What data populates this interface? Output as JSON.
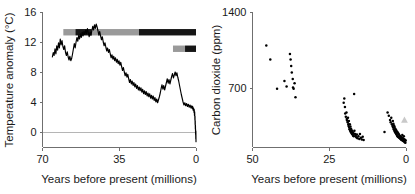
{
  "figure": {
    "title": "",
    "panels": [
      "temperature-anomaly",
      "carbon-dioxide"
    ]
  },
  "chart_data": [
    {
      "type": "line",
      "id": "temperature-anomaly",
      "title": "",
      "xlabel": "Years before present (millions)",
      "ylabel": "Temperature anomaly (°C)",
      "xlim": [
        70,
        0
      ],
      "ylim": [
        -2,
        16
      ],
      "xticks": [
        70,
        35,
        0
      ],
      "yticks": [
        16,
        12,
        8,
        4,
        0
      ],
      "xtick_labels": [
        "70",
        "35",
        "0"
      ],
      "ytick_labels": [
        "16",
        "12",
        "8",
        "4",
        "0"
      ],
      "grid": false,
      "zero_reference_line": 0,
      "legend": "none",
      "series": [
        {
          "name": "Temperature anomaly",
          "color": "#000000",
          "x": [
            65.5,
            65.1,
            64.7,
            64.3,
            63.9,
            63.5,
            63.1,
            62.7,
            62.3,
            61.9,
            61.5,
            61.1,
            60.7,
            60.3,
            59.9,
            59.5,
            59.1,
            58.7,
            58.3,
            57.9,
            57.5,
            57.1,
            56.7,
            56.3,
            55.9,
            55.5,
            55.1,
            54.7,
            54.3,
            53.9,
            53.5,
            53.1,
            52.7,
            52.3,
            51.9,
            51.5,
            51.1,
            50.7,
            50.3,
            49.9,
            49.5,
            49.1,
            48.7,
            48.3,
            47.9,
            47.5,
            47.1,
            46.7,
            46.3,
            45.9,
            45.5,
            45.1,
            44.7,
            44.3,
            43.9,
            43.5,
            43.1,
            42.7,
            42.3,
            41.9,
            41.5,
            41.1,
            40.7,
            40.3,
            39.9,
            39.5,
            39.1,
            38.7,
            38.3,
            37.9,
            37.5,
            37.1,
            36.7,
            36.3,
            35.9,
            35.5,
            35.1,
            34.7,
            34.3,
            33.9,
            33.5,
            33.1,
            32.7,
            32.3,
            31.9,
            31.5,
            31.1,
            30.7,
            30.3,
            29.9,
            29.5,
            29.1,
            28.7,
            28.3,
            27.9,
            27.5,
            27.1,
            26.7,
            26.3,
            25.9,
            25.5,
            25.1,
            24.7,
            24.3,
            23.9,
            23.5,
            23.1,
            22.7,
            22.3,
            21.9,
            21.5,
            21.1,
            20.7,
            20.3,
            19.9,
            19.5,
            19.1,
            18.7,
            18.3,
            17.9,
            17.5,
            17.1,
            16.7,
            16.3,
            15.9,
            15.5,
            15.1,
            14.7,
            14.3,
            13.9,
            13.5,
            13.1,
            12.7,
            12.3,
            11.9,
            11.5,
            11.1,
            10.7,
            10.3,
            9.9,
            9.5,
            9.1,
            8.7,
            8.3,
            7.9,
            7.5,
            7.1,
            6.7,
            6.3,
            5.9,
            5.5,
            5.1,
            4.7,
            4.3,
            3.9,
            3.5,
            3.1,
            2.7,
            2.3,
            1.9,
            1.7,
            1.5,
            1.3,
            1.1,
            0.9,
            0.8,
            0.7,
            0.6,
            0.5,
            0.45,
            0.4,
            0.35,
            0.3,
            0.25,
            0.2,
            0.15,
            0.1,
            0.05,
            0.0
          ],
          "y": [
            10.0,
            10.6,
            10.2,
            11.1,
            10.4,
            11.5,
            10.9,
            11.9,
            11.2,
            12.4,
            11.6,
            12.2,
            11.4,
            11.0,
            11.5,
            10.6,
            10.2,
            10.7,
            10.0,
            9.6,
            10.1,
            9.5,
            9.8,
            10.4,
            11.1,
            11.8,
            11.2,
            12.0,
            12.6,
            12.1,
            12.9,
            12.4,
            13.1,
            12.6,
            13.3,
            12.8,
            13.4,
            13.0,
            13.6,
            13.1,
            13.8,
            13.2,
            12.7,
            13.3,
            12.9,
            13.5,
            14.1,
            13.6,
            14.3,
            13.8,
            14.4,
            14.0,
            13.5,
            12.9,
            13.4,
            12.8,
            12.3,
            12.7,
            12.0,
            11.5,
            11.9,
            11.3,
            10.8,
            11.2,
            10.6,
            11.0,
            10.4,
            9.9,
            10.3,
            9.7,
            10.1,
            9.5,
            9.9,
            9.3,
            9.7,
            9.1,
            9.5,
            8.9,
            9.3,
            8.7,
            8.2,
            8.6,
            8.0,
            7.5,
            7.9,
            7.3,
            7.7,
            7.1,
            6.6,
            7.0,
            6.4,
            6.8,
            6.2,
            6.6,
            6.0,
            6.4,
            5.8,
            6.2,
            5.6,
            6.0,
            5.5,
            5.9,
            5.3,
            5.7,
            5.1,
            5.5,
            5.0,
            5.4,
            4.8,
            5.2,
            4.7,
            5.1,
            4.5,
            4.9,
            4.4,
            4.8,
            4.2,
            4.6,
            4.0,
            4.4,
            3.9,
            4.3,
            4.7,
            5.2,
            5.8,
            6.3,
            5.7,
            6.2,
            5.6,
            6.1,
            6.6,
            7.1,
            6.5,
            7.0,
            6.4,
            6.9,
            7.4,
            7.8,
            7.2,
            7.6,
            8.0,
            7.5,
            7.9,
            7.3,
            6.8,
            6.2,
            5.6,
            5.0,
            4.5,
            4.0,
            3.6,
            3.9,
            3.5,
            3.8,
            3.4,
            3.7,
            3.3,
            3.6,
            3.2,
            3.5,
            3.1,
            3.4,
            2.9,
            3.2,
            2.6,
            3.0,
            2.2,
            2.7,
            1.6,
            2.1,
            1.0,
            1.5,
            0.4,
            0.9,
            -0.3,
            0.3,
            -0.9,
            0.1,
            -1.3
          ]
        }
      ],
      "annotation_bars": [
        {
          "name": "upper-climate-state-bar",
          "y_value": 13.3,
          "segments": [
            {
              "x_start": 60.5,
              "x_end": 55.0,
              "color": "#9a9a9a"
            },
            {
              "x_start": 55.0,
              "x_end": 47.5,
              "color": "#161616"
            },
            {
              "x_start": 47.5,
              "x_end": 26.0,
              "color": "#9a9a9a"
            },
            {
              "x_start": 26.0,
              "x_end": 0.0,
              "color": "#161616"
            }
          ]
        },
        {
          "name": "lower-climate-state-bar",
          "y_value": 11.1,
          "segments": [
            {
              "x_start": 10.5,
              "x_end": 5.0,
              "color": "#9a9a9a"
            },
            {
              "x_start": 5.0,
              "x_end": 0.0,
              "color": "#161616"
            }
          ]
        }
      ]
    },
    {
      "type": "scatter",
      "id": "carbon-dioxide",
      "title": "",
      "xlabel": "Years before present (millions)",
      "ylabel": "Carbon dioxide (ppm)",
      "xlim": [
        50,
        0
      ],
      "ylim": [
        150,
        1400
      ],
      "xticks": [
        50,
        25,
        0
      ],
      "yticks": [
        1400,
        700
      ],
      "xtick_labels": [
        "50",
        "25",
        "0"
      ],
      "ytick_labels": [
        "1400",
        "700"
      ],
      "grid": false,
      "legend": "none",
      "series": [
        {
          "name": "Carbon dioxide proxy records",
          "color": "#000000",
          "points": [
            [
              45.5,
              1090
            ],
            [
              44.2,
              960
            ],
            [
              42.0,
              690
            ],
            [
              39.6,
              760
            ],
            [
              38.9,
              710
            ],
            [
              37.8,
              1010
            ],
            [
              37.6,
              960
            ],
            [
              37.4,
              900
            ],
            [
              37.2,
              840
            ],
            [
              36.9,
              780
            ],
            [
              36.8,
              700
            ],
            [
              36.6,
              690
            ],
            [
              36.3,
              740
            ],
            [
              36.0,
              610
            ],
            [
              20.3,
              560
            ],
            [
              20.1,
              600
            ],
            [
              19.9,
              520
            ],
            [
              19.8,
              460
            ],
            [
              19.6,
              430
            ],
            [
              19.4,
              470
            ],
            [
              19.3,
              410
            ],
            [
              19.2,
              395
            ],
            [
              19.0,
              380
            ],
            [
              18.9,
              420
            ],
            [
              18.8,
              360
            ],
            [
              18.7,
              345
            ],
            [
              18.6,
              390
            ],
            [
              18.5,
              330
            ],
            [
              18.4,
              315
            ],
            [
              18.3,
              360
            ],
            [
              18.2,
              300
            ],
            [
              18.1,
              340
            ],
            [
              18.0,
              290
            ],
            [
              17.9,
              320
            ],
            [
              17.8,
              280
            ],
            [
              17.7,
              305
            ],
            [
              17.6,
              270
            ],
            [
              17.5,
              295
            ],
            [
              17.4,
              265
            ],
            [
              17.3,
              285
            ],
            [
              17.2,
              255
            ],
            [
              17.1,
              275
            ],
            [
              17.0,
              250
            ],
            [
              16.9,
              640
            ],
            [
              16.8,
              300
            ],
            [
              16.6,
              270
            ],
            [
              16.4,
              255
            ],
            [
              16.2,
              240
            ],
            [
              16.0,
              265
            ],
            [
              15.8,
              230
            ],
            [
              15.5,
              250
            ],
            [
              15.2,
              225
            ],
            [
              15.0,
              270
            ],
            [
              14.7,
              235
            ],
            [
              14.4,
              220
            ],
            [
              14.1,
              245
            ],
            [
              13.8,
              215
            ],
            [
              7.0,
              290
            ],
            [
              6.0,
              470
            ],
            [
              5.6,
              440
            ],
            [
              5.2,
              400
            ],
            [
              5.0,
              380
            ],
            [
              4.8,
              420
            ],
            [
              4.6,
              360
            ],
            [
              4.4,
              345
            ],
            [
              4.3,
              390
            ],
            [
              4.2,
              330
            ],
            [
              4.1,
              365
            ],
            [
              4.0,
              315
            ],
            [
              3.9,
              350
            ],
            [
              3.8,
              300
            ],
            [
              3.7,
              335
            ],
            [
              3.6,
              290
            ],
            [
              3.5,
              320
            ],
            [
              3.4,
              280
            ],
            [
              3.3,
              310
            ],
            [
              3.2,
              270
            ],
            [
              3.1,
              300
            ],
            [
              3.0,
              260
            ],
            [
              2.9,
              290
            ],
            [
              2.8,
              250
            ],
            [
              2.7,
              285
            ],
            [
              2.6,
              245
            ],
            [
              2.5,
              275
            ],
            [
              2.4,
              240
            ],
            [
              2.3,
              265
            ],
            [
              2.2,
              235
            ],
            [
              2.1,
              255
            ],
            [
              2.0,
              230
            ],
            [
              1.9,
              250
            ],
            [
              1.8,
              225
            ],
            [
              1.7,
              245
            ],
            [
              1.6,
              220
            ],
            [
              1.5,
              240
            ],
            [
              1.4,
              215
            ],
            [
              1.3,
              235
            ],
            [
              1.2,
              260
            ],
            [
              1.1,
              210
            ],
            [
              1.0,
              230
            ],
            [
              0.9,
              205
            ],
            [
              0.8,
              225
            ],
            [
              0.7,
              250
            ],
            [
              0.6,
              200
            ],
            [
              0.5,
              220
            ],
            [
              0.4,
              195
            ],
            [
              0.3,
              215
            ],
            [
              0.2,
              190
            ],
            [
              0.1,
              210
            ]
          ]
        }
      ],
      "special_markers": [
        {
          "name": "modern-co2-marker",
          "shape": "triangle",
          "color": "#c9c9c9",
          "x": 0.5,
          "y": 400
        }
      ]
    }
  ]
}
